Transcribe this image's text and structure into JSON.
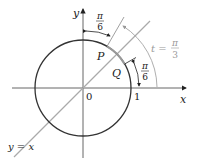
{
  "figure": {
    "axes": {
      "x_label": "x",
      "y_label": "y"
    },
    "origin_label": "0",
    "unit_label": "1",
    "line_label": "y = x",
    "points": {
      "P": "P",
      "Q": "Q"
    },
    "angles": {
      "top_pi": "π",
      "top_den": "6",
      "right_pi": "π",
      "right_den": "6",
      "t_label": "t =",
      "t_pi": "π",
      "t_den": "3"
    },
    "colors": {
      "circle": "#333333",
      "axes": "#555555",
      "line": "#aaaaaa",
      "arc_highlight": "#999999"
    }
  }
}
